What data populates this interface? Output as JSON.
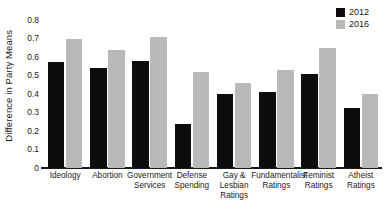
{
  "chart_data": {
    "type": "bar",
    "title": "",
    "xlabel": "",
    "ylabel": "Difference in Party Means",
    "ylim": [
      0,
      0.8
    ],
    "yticks": [
      "0",
      "0.1",
      "0.2",
      "0.3",
      "0.4",
      "0.5",
      "0.6",
      "0.7",
      "0.8"
    ],
    "ytick_values": [
      0,
      0.1,
      0.2,
      0.3,
      0.4,
      0.5,
      0.6,
      0.7,
      0.8
    ],
    "grid": false,
    "legend_position": "top-right",
    "categories": [
      "Ideology",
      "Abortion",
      "Government Services",
      "Defense Spending",
      "Gay & Lesbian Ratings",
      "Fundamentalist Ratings",
      "Feminist Ratings",
      "Atheist Ratings"
    ],
    "category_lines": [
      [
        "Ideology"
      ],
      [
        "Abortion"
      ],
      [
        "Government",
        "Services"
      ],
      [
        "Defense",
        "Spending"
      ],
      [
        "Gay &",
        "Lesbian",
        "Ratings"
      ],
      [
        "Fundamentalist",
        "Ratings"
      ],
      [
        "Feminist",
        "Ratings"
      ],
      [
        "Atheist",
        "Ratings"
      ]
    ],
    "series": [
      {
        "name": "2012",
        "color": "#0d0d0d",
        "values": [
          0.575,
          0.54,
          0.58,
          0.24,
          0.4,
          0.41,
          0.51,
          0.325
        ]
      },
      {
        "name": "2016",
        "color": "#b9b9b9",
        "values": [
          0.7,
          0.64,
          0.71,
          0.52,
          0.46,
          0.53,
          0.65,
          0.4
        ]
      }
    ]
  },
  "legend": {
    "items": [
      {
        "label": "2012",
        "color": "#0d0d0d"
      },
      {
        "label": "2016",
        "color": "#b9b9b9"
      }
    ]
  },
  "axes": {
    "y_title": "Difference in Party Means"
  }
}
